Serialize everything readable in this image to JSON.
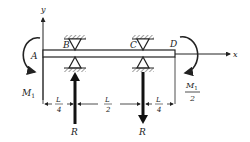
{
  "diagram": {
    "type": "beam-free-body-diagram",
    "axes": {
      "x_label": "x",
      "y_label": "y"
    },
    "points": {
      "A": "A",
      "B": "B",
      "C": "C",
      "D": "D"
    },
    "moments": {
      "left": {
        "symbol": "M",
        "subscript": "1"
      },
      "right": {
        "numerator_symbol": "M",
        "numerator_subscript": "1",
        "denominator": "2"
      }
    },
    "reactions": {
      "at_B": {
        "label": "R",
        "direction": "up"
      },
      "at_C": {
        "label": "R",
        "direction": "down"
      }
    },
    "dimensions": [
      {
        "num": "L",
        "den": "4"
      },
      {
        "num": "L",
        "den": "2"
      },
      {
        "num": "L",
        "den": "4"
      }
    ],
    "colors": {
      "ink": "#222222",
      "background": "#ffffff"
    }
  }
}
